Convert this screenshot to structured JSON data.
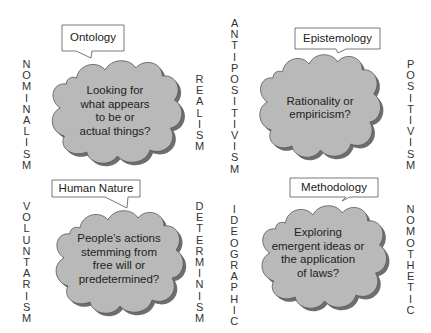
{
  "quadrants": [
    {
      "id": "ontology",
      "label": "Ontology",
      "question": "Looking for what appears to be or actual things?",
      "question_lines": [
        "Looking for",
        "what appears",
        "to be or",
        "actual things?"
      ],
      "left_pole": "NOMINALISM",
      "right_pole": "REALISM"
    },
    {
      "id": "epistemology",
      "label": "Epistemology",
      "question": "Rationality or empiricism?",
      "question_lines": [
        "Rationality or",
        "empiricism?"
      ],
      "left_pole": "ANTIPOSITIVISM",
      "right_pole": "POSITIVISM"
    },
    {
      "id": "human-nature",
      "label": "Human Nature",
      "question": "People's actions stemming from free will or predetermined?",
      "question_lines": [
        "People’s actions",
        "stemming from",
        "free will or",
        "predetermined?"
      ],
      "left_pole": "VOLUNTARISM",
      "right_pole": "DETERMINISM"
    },
    {
      "id": "methodology",
      "label": "Methodology",
      "question": "Exploring emergent ideas or the application of laws?",
      "question_lines": [
        "Exploring",
        "emergent ideas or",
        "the application",
        "of laws?"
      ],
      "left_pole": "IDEOGRAPHIC",
      "right_pole": "NOMOTHETIC"
    }
  ],
  "colors": {
    "cloud_fill": "#b9b9b9",
    "cloud_shadow": "#6e6e6e",
    "cloud_stroke": "#555555",
    "callout_fill": "#ffffff",
    "callout_stroke": "#555555",
    "text": "#222222"
  }
}
